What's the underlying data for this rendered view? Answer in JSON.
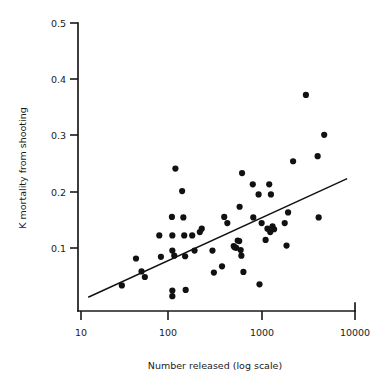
{
  "chart_data": {
    "type": "scatter",
    "title": "",
    "xlabel": "Number released (log scale)",
    "ylabel": "K mortality from shooting",
    "xscale": "log",
    "yscale": "linear",
    "xlim": [
      10,
      10000
    ],
    "ylim": [
      0,
      0.5
    ],
    "grid": false,
    "legend": null,
    "xticks": [
      10,
      100,
      1000,
      10000
    ],
    "xtick_labels": [
      "10",
      "100",
      "1000",
      "10000"
    ],
    "yticks": [
      0.1,
      0.2,
      0.3,
      0.4,
      0.5
    ],
    "ytick_labels": [
      "0.1",
      "0.2",
      "0.3",
      "0.4",
      "0.5"
    ],
    "series": [
      {
        "name": "K mortality from shooting",
        "marker": "filled-circle",
        "color": "#111111",
        "points": [
          [
            28,
            0.033
          ],
          [
            40,
            0.081
          ],
          [
            46,
            0.058
          ],
          [
            50,
            0.048
          ],
          [
            72,
            0.122
          ],
          [
            75,
            0.084
          ],
          [
            99,
            0.155
          ],
          [
            100,
            0.122
          ],
          [
            100,
            0.095
          ],
          [
            100,
            0.024
          ],
          [
            100,
            0.014
          ],
          [
            105,
            0.086
          ],
          [
            108,
            0.241
          ],
          [
            128,
            0.201
          ],
          [
            132,
            0.154
          ],
          [
            135,
            0.122
          ],
          [
            138,
            0.085
          ],
          [
            140,
            0.025
          ],
          [
            165,
            0.122
          ],
          [
            175,
            0.095
          ],
          [
            200,
            0.128
          ],
          [
            210,
            0.134
          ],
          [
            275,
            0.095
          ],
          [
            285,
            0.056
          ],
          [
            350,
            0.067
          ],
          [
            370,
            0.155
          ],
          [
            400,
            0.144
          ],
          [
            470,
            0.103
          ],
          [
            480,
            0.101
          ],
          [
            500,
            0.1
          ],
          [
            520,
            0.113
          ],
          [
            540,
            0.112
          ],
          [
            545,
            0.173
          ],
          [
            560,
            0.096
          ],
          [
            570,
            0.086
          ],
          [
            580,
            0.233
          ],
          [
            600,
            0.057
          ],
          [
            760,
            0.213
          ],
          [
            770,
            0.154
          ],
          [
            880,
            0.195
          ],
          [
            900,
            0.035
          ],
          [
            950,
            0.144
          ],
          [
            1050,
            0.114
          ],
          [
            1100,
            0.134
          ],
          [
            1150,
            0.213
          ],
          [
            1180,
            0.128
          ],
          [
            1200,
            0.195
          ],
          [
            1250,
            0.138
          ],
          [
            1300,
            0.133
          ],
          [
            1700,
            0.144
          ],
          [
            1780,
            0.104
          ],
          [
            1850,
            0.163
          ],
          [
            2100,
            0.254
          ],
          [
            2900,
            0.372
          ],
          [
            3900,
            0.263
          ],
          [
            4000,
            0.154
          ],
          [
            4600,
            0.301
          ]
        ]
      }
    ],
    "annotations": [
      {
        "type": "regression-line",
        "x_start": 12,
        "y_start": 0.012,
        "x_end": 8200,
        "y_end": 0.223
      }
    ]
  },
  "axes": {
    "y_axis_label": "K mortality from shooting",
    "x_axis_label": "Number released (log scale)"
  }
}
